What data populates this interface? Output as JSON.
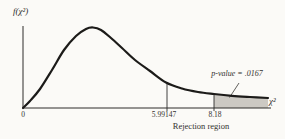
{
  "chart_data": {
    "type": "area",
    "title": "",
    "ylabel": "f(χ²)",
    "xlabel": "χ²",
    "x_ticks": [
      "0",
      "5.99147",
      "8.18"
    ],
    "critical_value": 5.99147,
    "test_statistic": 8.18,
    "p_value": 0.0167,
    "p_value_label": "p-value = .0167",
    "rejection_region_label": "Rejection region",
    "shaded_region": "upper tail, χ² ≥ 8.18",
    "grid": false,
    "legend": "none",
    "colors": {
      "curve": "#1c1b19",
      "shade": "#ccc9c3",
      "axis": "#2e2d2a",
      "marker": "#2e2d2a",
      "leader": "#3a3935"
    },
    "geometry_px": {
      "axis": {
        "x0": 23,
        "x1": 271,
        "y": 108,
        "y_axis_top": 26
      },
      "curve": [
        [
          23,
          108
        ],
        [
          30,
          101
        ],
        [
          40,
          89
        ],
        [
          52,
          70
        ],
        [
          64,
          50
        ],
        [
          76,
          36
        ],
        [
          86,
          29
        ],
        [
          93,
          27.5
        ],
        [
          101,
          30
        ],
        [
          111,
          38
        ],
        [
          122,
          48
        ],
        [
          135,
          60
        ],
        [
          150,
          71
        ],
        [
          166,
          82.5
        ],
        [
          182,
          88.5
        ],
        [
          198,
          92
        ],
        [
          214,
          94
        ],
        [
          232,
          95.8
        ],
        [
          250,
          97
        ],
        [
          268,
          98
        ]
      ],
      "marker_xs": [
        167,
        214
      ],
      "marker_bottom_y": 111,
      "shade_from_x": 214,
      "leader_line": [
        [
          239,
          83
        ],
        [
          229.5,
          97.5
        ]
      ]
    }
  }
}
